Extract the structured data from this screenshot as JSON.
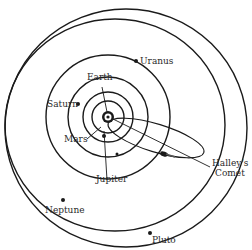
{
  "diagram": {
    "colors": {
      "line": "#1a1a1a",
      "background": "#ffffff",
      "text": "#2a2a2a"
    },
    "labels": {
      "earth": "Earth",
      "saturn": "Saturn",
      "uranus": "Uranus",
      "mars": "Mars",
      "jupiter": "Jupiter",
      "neptune": "Neptune",
      "pluto": "Pluto",
      "comet_line1": "Halley's",
      "comet_line2": "Comet"
    },
    "bodies": [
      {
        "name": "Sun",
        "x": 108,
        "y": 117
      },
      {
        "name": "Earth",
        "orbit_radius": 16
      },
      {
        "name": "Mars",
        "orbit_radius": 25
      },
      {
        "name": "Jupiter",
        "orbit_radius": 40
      },
      {
        "name": "Saturn",
        "orbit_radius": 40
      },
      {
        "name": "Uranus",
        "orbit_radius": 62
      },
      {
        "name": "Neptune",
        "orbit": "ellipse"
      },
      {
        "name": "Pluto",
        "orbit": "ellipse"
      },
      {
        "name": "Halley's Comet",
        "orbit": "eccentric ellipse"
      }
    ]
  }
}
